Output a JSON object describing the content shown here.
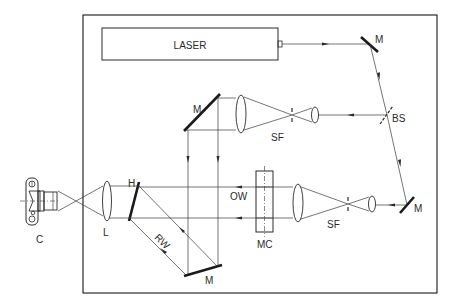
{
  "diagram": {
    "type": "optical-setup",
    "components": {
      "laser": {
        "label": "LASER"
      },
      "mirror_top_right": {
        "label": "M"
      },
      "beam_splitter": {
        "label": "BS"
      },
      "mirror_upper": {
        "label": "M"
      },
      "spatial_filter_upper": {
        "label": "SF"
      },
      "mirror_lower_right": {
        "label": "M"
      },
      "spatial_filter_lower": {
        "label": "SF"
      },
      "cell": {
        "label": "MC"
      },
      "object_wave": {
        "label": "OW"
      },
      "hologram": {
        "label": "H"
      },
      "reference_wave": {
        "label": "RW"
      },
      "mirror_bottom": {
        "label": "M"
      },
      "lens": {
        "label": "L"
      },
      "camera": {
        "label": "C"
      }
    }
  }
}
